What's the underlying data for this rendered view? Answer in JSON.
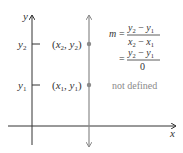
{
  "diagram": {
    "axes": {
      "x_label": "x",
      "y_label": "y"
    },
    "tick_labels": {
      "y2": "y2",
      "y1": "y1"
    },
    "points": [
      {
        "label": "(x2, y2)",
        "x_sub": "2",
        "y_sub": "2"
      },
      {
        "label": "(x1, y1)",
        "x_sub": "1",
        "y_sub": "1"
      }
    ],
    "formula": {
      "m_label": "m",
      "equals": "=",
      "line1_num": "y2 − y1",
      "line1_den": "x2 − x1",
      "line2_num": "y2 − y1",
      "line2_den": "0",
      "result": "not defined"
    },
    "colors": {
      "axis": "#333333",
      "vertical_line": "#8a8a8a",
      "point": "#8a8a8a",
      "text": "#333333",
      "note": "#8a8a8a"
    }
  }
}
